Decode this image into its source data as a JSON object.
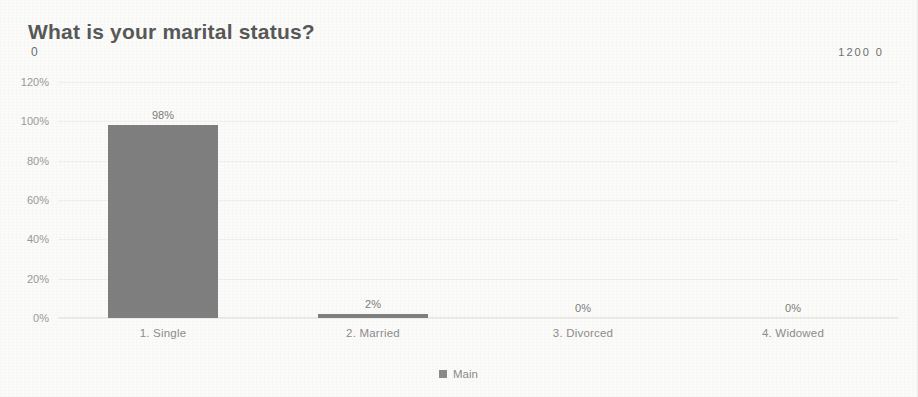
{
  "header": {
    "title": "What is your marital status?",
    "corner_left_value": "0",
    "corner_right_value": "1200 0"
  },
  "legend": {
    "series_label": "Main",
    "swatch_color": "#8a8a8a"
  },
  "axis": {
    "y_ticks": [
      "120%",
      "100%",
      "80%",
      "60%",
      "40%",
      "20%",
      "0%"
    ]
  },
  "chart_data": {
    "type": "bar",
    "title": "What is your marital status?",
    "xlabel": "",
    "ylabel": "",
    "categories": [
      "1. Single",
      "2. Married",
      "3. Divorced",
      "4. Widowed"
    ],
    "values": [
      98,
      2,
      0,
      0
    ],
    "data_labels": [
      "98%",
      "2%",
      "0%",
      "0%"
    ],
    "series": [
      {
        "name": "Main",
        "values": [
          98,
          2,
          0,
          0
        ]
      }
    ],
    "ylim": [
      0,
      120
    ],
    "y_tick_values": [
      0,
      20,
      40,
      60,
      80,
      100,
      120
    ],
    "y_tick_labels": [
      "0%",
      "20%",
      "40%",
      "60%",
      "80%",
      "100%",
      "120%"
    ],
    "grid": true,
    "legend_position": "bottom",
    "bar_color": "#7f7f7f",
    "value_suffix": "%"
  }
}
